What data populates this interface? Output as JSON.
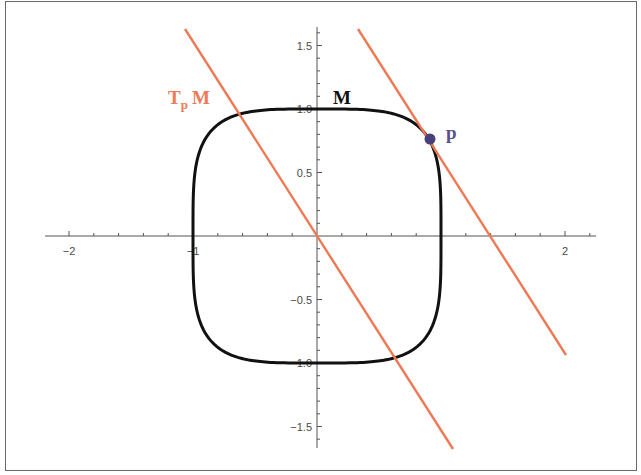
{
  "figure": {
    "labels": {
      "manifold": "M",
      "tangent_T": "T",
      "tangent_sub": "p",
      "tangent_M": "M",
      "point": "p"
    },
    "colors": {
      "curve": "#111111",
      "tangent_line": "#ee7a55",
      "point": "#4b3f7a",
      "point_label": "#5a4f86",
      "axis": "#555555",
      "tick_label": "#4a4a4a"
    }
  },
  "chart_data": {
    "type": "line",
    "title": "",
    "xlabel": "",
    "ylabel": "",
    "xlim": [
      -2.2,
      2.2
    ],
    "ylim": [
      -1.65,
      1.65
    ],
    "grid": false,
    "x_ticks": [
      -2,
      -1,
      1,
      2
    ],
    "x_tick_labels": [
      "−2",
      "−1",
      "",
      "2"
    ],
    "y_ticks": [
      -1.5,
      -1.0,
      -0.5,
      0.5,
      1.0,
      1.5
    ],
    "y_tick_labels": [
      "−1.5",
      "−1.0",
      "−0.5",
      "0.5",
      "1.0",
      "1.5"
    ],
    "series": [
      {
        "name": "M",
        "kind": "curve",
        "equation": "x^4 + y^4 = 1"
      },
      {
        "name": "T_p M",
        "kind": "line",
        "through": [
          0,
          0
        ],
        "slope": -1.57
      },
      {
        "name": "tangent at p",
        "kind": "line",
        "through": [
          0.9,
          0.77
        ],
        "slope": -1.57
      }
    ],
    "points": [
      {
        "label": "p",
        "x": 0.9,
        "y": 0.77
      }
    ],
    "annotations": [
      {
        "text": "T_p M",
        "x": -1.0,
        "y": 1.04
      },
      {
        "text": "M",
        "x": 0.15,
        "y": 1.04
      },
      {
        "text": "p",
        "x": 1.05,
        "y": 0.8
      }
    ]
  }
}
